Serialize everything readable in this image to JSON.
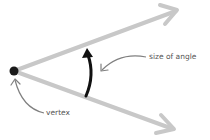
{
  "diagram": {
    "labels": {
      "size_of_angle": "size of angle",
      "vertex": "vertex"
    },
    "colors": {
      "ray": "#c8c8c8",
      "angle_arrow": "#111111",
      "pointer": "#808080",
      "vertex_dot": "#1a1a1a",
      "text": "#555555"
    },
    "vertex": {
      "x": 14,
      "y": 71
    },
    "rays": [
      {
        "name": "upper-ray",
        "tip": {
          "x": 178,
          "y": 10
        }
      },
      {
        "name": "lower-ray",
        "tip": {
          "x": 175,
          "y": 130
        }
      }
    ]
  }
}
